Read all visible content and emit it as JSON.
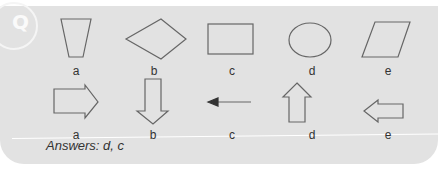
{
  "badge": "Q",
  "row1": {
    "shapes": [
      "trapezoid",
      "diamond",
      "rectangle",
      "ellipse",
      "parallelogram"
    ],
    "labels": [
      "a",
      "b",
      "c",
      "d",
      "e"
    ]
  },
  "row2": {
    "shapes": [
      "arrow-right-outline",
      "arrow-down-outline",
      "arrow-left-line",
      "arrow-up-outline",
      "arrow-left-outline"
    ],
    "labels": [
      "a",
      "b",
      "c",
      "d",
      "e"
    ]
  },
  "answers": "Answers: d, c",
  "colors": {
    "panel": "#e2e2e2",
    "stroke": "#666666",
    "text": "#333333"
  }
}
